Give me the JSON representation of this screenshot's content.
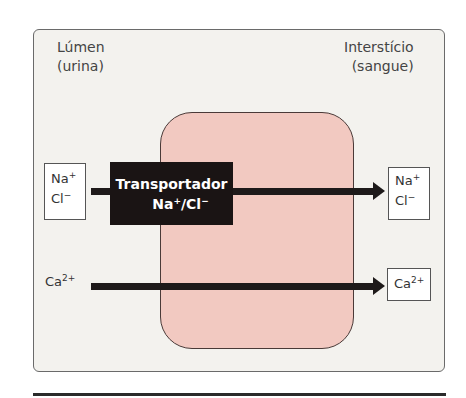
{
  "diagram": {
    "left_compartment": {
      "line1": "Lúmen",
      "line2": "(urina)"
    },
    "right_compartment": {
      "line1": "Interstício",
      "line2": "(sangue)"
    },
    "transporter": {
      "line1": "Transportador",
      "line2_base_na": "Na",
      "line2_sup_na": "+",
      "line2_sep": "/Cl",
      "line2_sup_cl": "−"
    },
    "ions_left_top": {
      "na": "Na",
      "na_charge": "+",
      "cl": "Cl",
      "cl_charge": "−"
    },
    "ions_right_top": {
      "na": "Na",
      "na_charge": "+",
      "cl": "Cl",
      "cl_charge": "−"
    },
    "ca_left": {
      "base": "Ca",
      "charge": "2+"
    },
    "ca_right": {
      "base": "Ca",
      "charge": "2+"
    },
    "colors": {
      "panel_bg": "#f3f2ee",
      "cell_fill": "#f2c9c1",
      "transporter_fill": "#1a1414",
      "arrow": "#1e1a1a"
    }
  }
}
